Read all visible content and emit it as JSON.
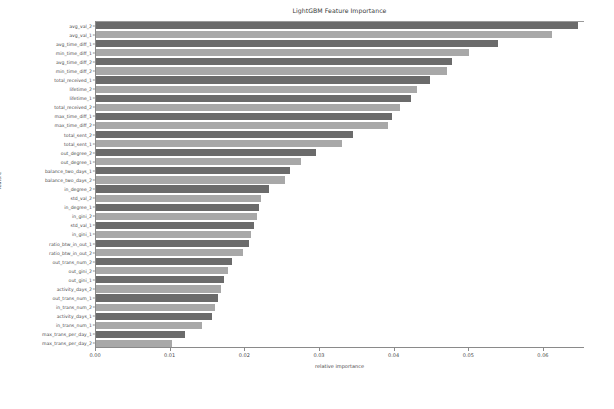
{
  "chart_data": {
    "type": "bar",
    "orientation": "horizontal",
    "title": "LightGBM Feature Importance",
    "xlabel": "relative importance",
    "ylabel": "feature",
    "xlim": [
      0,
      0.0655
    ],
    "xticks": [
      0.0,
      0.01,
      0.02,
      0.03,
      0.04,
      0.05,
      0.06
    ],
    "xtick_labels": [
      "0.00",
      "0.01",
      "0.02",
      "0.03",
      "0.04",
      "0.05",
      "0.06"
    ],
    "grid": false,
    "legend": "none",
    "bar_colors": [
      "#6b6b6b",
      "#a8a8a8"
    ],
    "categories": [
      "avg_val_2",
      "avg_val_1",
      "avg_time_diff_1",
      "min_time_diff_1",
      "avg_time_diff_2",
      "min_time_diff_2",
      "total_received_1",
      "lifetime_2",
      "lifetime_1",
      "total_received_2",
      "max_time_diff_1",
      "max_time_diff_2",
      "total_sent_2",
      "total_sent_1",
      "out_degree_2",
      "out_degree_1",
      "balance_two_days_1",
      "balance_two_days_2",
      "in_degree_2",
      "std_val_2",
      "in_degree_1",
      "in_gini_2",
      "std_val_1",
      "in_gini_1",
      "ratio_btw_in_out_1",
      "ratio_btw_in_out_2",
      "out_trans_num_2",
      "out_gini_2",
      "out_gini_1",
      "activity_days_2",
      "out_trans_num_1",
      "in_trans_num_2",
      "activity_days_1",
      "in_trans_num_1",
      "max_trans_per_day_1",
      "max_trans_per_day_2"
    ],
    "values": [
      0.0645,
      0.0611,
      0.0538,
      0.05,
      0.0477,
      0.047,
      0.0447,
      0.043,
      0.0422,
      0.0407,
      0.0397,
      0.0391,
      0.0344,
      0.033,
      0.0295,
      0.0275,
      0.026,
      0.0253,
      0.0232,
      0.0221,
      0.0218,
      0.0215,
      0.0212,
      0.0208,
      0.0205,
      0.0197,
      0.0182,
      0.0177,
      0.0172,
      0.0168,
      0.0164,
      0.016,
      0.0155,
      0.0142,
      0.0119,
      0.0102
    ]
  }
}
